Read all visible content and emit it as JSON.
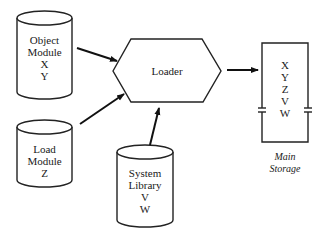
{
  "diagram": {
    "object_module": {
      "lines": [
        "Object",
        "Module",
        "X",
        "Y"
      ]
    },
    "load_module": {
      "lines": [
        "Load",
        "Module",
        "Z"
      ]
    },
    "system_library": {
      "lines": [
        "System",
        "Library",
        "V",
        "W"
      ]
    },
    "loader": {
      "label": "Loader"
    },
    "main_storage": {
      "contents": [
        "X",
        "Y",
        "Z",
        "V",
        "W"
      ],
      "caption": [
        "Main",
        "Storage"
      ]
    },
    "edges": [
      {
        "from": "object_module",
        "to": "loader"
      },
      {
        "from": "load_module",
        "to": "loader"
      },
      {
        "from": "system_library",
        "to": "loader"
      },
      {
        "from": "loader",
        "to": "main_storage"
      }
    ]
  }
}
